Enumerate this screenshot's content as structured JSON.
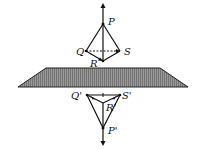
{
  "diagram": {
    "colors": {
      "ink": "#111111",
      "plane_fill": "#8a8a8a",
      "plane_stroke": "#222222"
    },
    "object": {
      "labels": {
        "P": "P",
        "Q": "Q",
        "R": "R",
        "S": "S"
      }
    },
    "image": {
      "labels": {
        "P": "P'",
        "Q": "Q'",
        "R": "R'",
        "S": "S'"
      }
    }
  }
}
